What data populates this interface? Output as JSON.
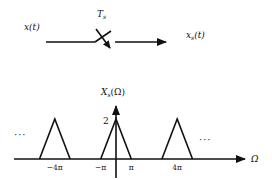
{
  "sampler": {
    "input_label": "x(t)",
    "period_label": "T",
    "period_sub": "s",
    "output_label": "x",
    "output_sub": "s",
    "output_arg": "(t)"
  },
  "spectrum": {
    "ylabel": "X",
    "ylabel_sub": "s",
    "ylabel_arg": "(Ω)",
    "xlabel": "Ω",
    "peak_label": "2",
    "ellipsis_left": "···",
    "ellipsis_right": "···",
    "ticks": [
      {
        "label": "−4π",
        "value": -4
      },
      {
        "label": "−π",
        "value": -1
      },
      {
        "label": "π",
        "value": 1
      },
      {
        "label": "4π",
        "value": 4
      }
    ],
    "triangles": [
      {
        "center": -4,
        "half_width": 1,
        "height": 2
      },
      {
        "center": 0,
        "half_width": 1,
        "height": 2
      },
      {
        "center": 4,
        "half_width": 1,
        "height": 2
      }
    ]
  }
}
